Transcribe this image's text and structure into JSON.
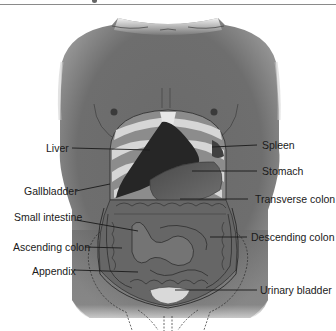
{
  "diagram": {
    "type": "anatomical-diagram",
    "colors": {
      "skin": "#6f6f6f",
      "skin_light": "#a8a8a8",
      "liver": "#262626",
      "ribs": "#d6d6d6",
      "stomach": "#5a5a5a",
      "intestine": "#6b6b6b",
      "bladder": "#d9d9d9",
      "label_text": "#1a1a1a",
      "leader_line": "#1a1a1a"
    },
    "labels_left": [
      {
        "id": "liver",
        "text": "Liver"
      },
      {
        "id": "gallbladder",
        "text": "Gallbladder"
      },
      {
        "id": "small-intestine",
        "text": "Small intestine"
      },
      {
        "id": "ascending-colon",
        "text": "Ascending colon"
      },
      {
        "id": "appendix",
        "text": "Appendix"
      }
    ],
    "labels_right": [
      {
        "id": "spleen",
        "text": "Spleen"
      },
      {
        "id": "stomach",
        "text": "Stomach"
      },
      {
        "id": "transverse-colon",
        "text": "Transverse colon"
      },
      {
        "id": "descending-colon",
        "text": "Descending colon"
      },
      {
        "id": "urinary-bladder",
        "text": "Urinary bladder"
      }
    ]
  }
}
